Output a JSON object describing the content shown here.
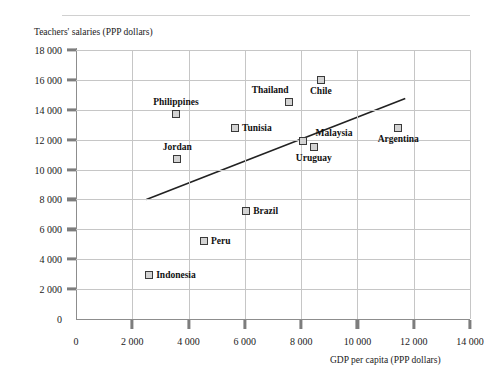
{
  "figure": {
    "top_caption": "",
    "y_axis_title": "Teachers' salaries (PPP dollars)",
    "x_axis_title": "GDP per capita (PPP dollars)"
  },
  "chart_data": {
    "type": "scatter",
    "title": "",
    "xlabel": "GDP per capita (PPP dollars)",
    "ylabel": "Teachers' salaries (PPP dollars)",
    "xlim": [
      0,
      14000
    ],
    "ylim": [
      0,
      18000
    ],
    "xticks": [
      0,
      2000,
      4000,
      6000,
      8000,
      10000,
      12000,
      14000
    ],
    "yticks": [
      0,
      2000,
      4000,
      6000,
      8000,
      10000,
      12000,
      14000,
      16000,
      18000
    ],
    "xtick_labels": [
      "0",
      "2 000",
      "4 000",
      "6 000",
      "8 000",
      "10 000",
      "12 000",
      "14 000"
    ],
    "ytick_labels": [
      "0",
      "2 000",
      "4 000",
      "6 000",
      "8 000",
      "10 000",
      "12 000",
      "14 000",
      "16 000",
      "18 000"
    ],
    "grid": "both",
    "legend": "none",
    "marker_style": "open-square",
    "points": [
      {
        "name": "Philippines",
        "x": 3550,
        "y": 13750,
        "label_pos": "above"
      },
      {
        "name": "Thailand",
        "x": 7570,
        "y": 14500,
        "label_pos": "above",
        "label_x": 6900
      },
      {
        "name": "Chile",
        "x": 8700,
        "y": 16000,
        "label_pos": "below"
      },
      {
        "name": "Tunisia",
        "x": 5650,
        "y": 12800,
        "label_pos": "right"
      },
      {
        "name": "Argentina",
        "x": 11450,
        "y": 12800,
        "label_pos": "below"
      },
      {
        "name": "Malaysia",
        "x": 8050,
        "y": 11900,
        "label_pos": "right",
        "label_dx": 6,
        "label_dy": -8
      },
      {
        "name": "Uruguay",
        "x": 8450,
        "y": 11500,
        "label_pos": "below"
      },
      {
        "name": "Jordan",
        "x": 3600,
        "y": 10700,
        "label_pos": "above"
      },
      {
        "name": "Brazil",
        "x": 6050,
        "y": 7200,
        "label_pos": "right"
      },
      {
        "name": "Peru",
        "x": 4550,
        "y": 5200,
        "label_pos": "right"
      },
      {
        "name": "Indonesia",
        "x": 2600,
        "y": 2950,
        "label_pos": "right"
      }
    ],
    "trendline": {
      "x1": 2500,
      "y1": 8000,
      "x2": 11700,
      "y2": 14750
    }
  }
}
